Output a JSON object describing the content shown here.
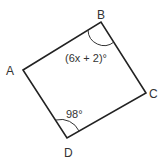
{
  "figure": {
    "vertices": {
      "A": {
        "label": "A",
        "x": 23,
        "y": 70
      },
      "B": {
        "label": "B",
        "x": 101,
        "y": 22
      },
      "C": {
        "label": "C",
        "x": 146,
        "y": 93
      },
      "D": {
        "label": "D",
        "x": 67,
        "y": 138
      }
    },
    "angles": {
      "B": "(6x + 2)°",
      "D": "98°"
    },
    "stroke_color": "#222222",
    "text_color": "#333333"
  }
}
